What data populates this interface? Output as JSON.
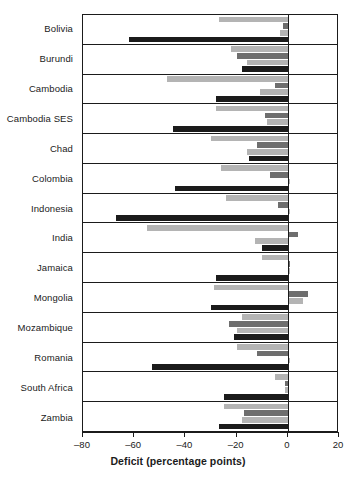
{
  "chart_data": {
    "type": "bar",
    "orientation": "horizontal",
    "title": "",
    "xlabel": "Deficit (percentage points)",
    "ylabel": "",
    "xlim": [
      -80,
      20
    ],
    "xticks": [
      -80,
      -60,
      -40,
      -20,
      0,
      20
    ],
    "xtick_labels": [
      "–80",
      "–60",
      "–40",
      "–20",
      "0",
      "20"
    ],
    "grid": false,
    "legend": "none",
    "zero_line": 0,
    "categories": [
      "Bolivia",
      "Burundi",
      "Cambodia",
      "Cambodia SES",
      "Chad",
      "Colombia",
      "Indonesia",
      "India",
      "Jamaica",
      "Mongolia",
      "Mozambique",
      "Romania",
      "South Africa",
      "Zambia"
    ],
    "series": [
      {
        "name": "series-1",
        "color": "#b4b4b4",
        "values": [
          -27,
          -22,
          -47,
          -28,
          -30,
          -26,
          -24,
          -55,
          -10,
          -29,
          -18,
          -20,
          -5,
          -25
        ]
      },
      {
        "name": "series-2",
        "color": "#6e6e6e",
        "values": [
          -2,
          -20,
          -5,
          -9,
          -12,
          -7,
          -4,
          4,
          1,
          8,
          -23,
          -12,
          -1,
          -17
        ]
      },
      {
        "name": "series-3",
        "color": "#b4b4b4",
        "values": [
          -3,
          -16,
          -11,
          -8,
          -16,
          1,
          1,
          -13,
          1,
          6,
          -20,
          1,
          -1,
          -18
        ]
      },
      {
        "name": "series-4",
        "color": "#1b1b1b",
        "values": [
          -62,
          -18,
          -28,
          -45,
          -15,
          -44,
          -67,
          -10,
          -28,
          -30,
          -21,
          -53,
          -25,
          -27
        ]
      }
    ]
  },
  "colors": {
    "axis": "#1b1b1b",
    "background": "#ffffff",
    "light_gray": "#b4b4b4",
    "mid_gray": "#6e6e6e",
    "dark": "#1b1b1b"
  }
}
